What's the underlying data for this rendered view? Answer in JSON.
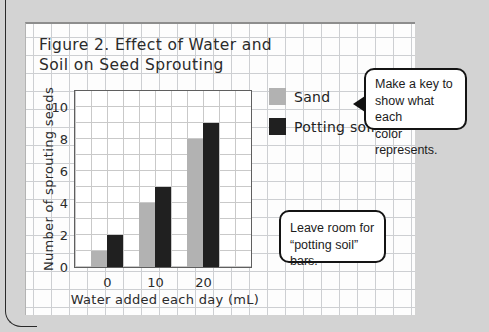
{
  "figure": {
    "title_lines": [
      "Figure 2. Effect of Water and",
      "Soil on Seed Sprouting"
    ]
  },
  "chart_data": {
    "type": "bar",
    "title": "Figure 2. Effect of Water and Soil on Seed Sprouting",
    "xlabel": "Water added each day (mL)",
    "ylabel": "Number of sprouting seeds",
    "categories": [
      "0",
      "10",
      "20"
    ],
    "series": [
      {
        "name": "Sand",
        "color": "#b2b2b2",
        "values": [
          1,
          4,
          8
        ]
      },
      {
        "name": "Potting soil",
        "color": "#202020",
        "values": [
          2,
          5,
          9
        ]
      }
    ],
    "ylim": [
      0,
      11
    ],
    "yticks": [
      0,
      2,
      4,
      6,
      8,
      10
    ],
    "grid": true,
    "legend_position": "right"
  },
  "callouts": {
    "key_note": {
      "lines": [
        "Make a key to",
        "show what each",
        "color represents."
      ]
    },
    "room_note": {
      "lines": [
        "Leave room for",
        "“potting soil” bars."
      ]
    }
  },
  "colors": {
    "page_background": "#d3d3d3",
    "paper": "#fdfdfd",
    "grid_line": "#cdcfd2",
    "plot_border": "#5f5f5f",
    "sand_bar": "#b2b2b2",
    "potting_soil_bar": "#202020",
    "callout_border": "#141414"
  }
}
